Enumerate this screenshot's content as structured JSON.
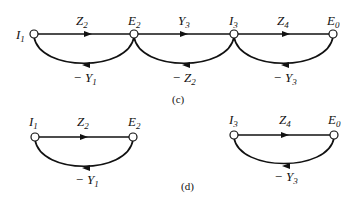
{
  "figure": {
    "c": {
      "caption": "(c)",
      "nodes": [
        {
          "id": "I1",
          "label": "I",
          "sub": "1"
        },
        {
          "id": "E2",
          "label": "E",
          "sub": "2"
        },
        {
          "id": "I3",
          "label": "I",
          "sub": "3"
        },
        {
          "id": "E0",
          "label": "E",
          "sub": "0"
        }
      ],
      "forward_edges": [
        {
          "from": "I1",
          "to": "E2",
          "label": "Z",
          "sub": "2"
        },
        {
          "from": "E2",
          "to": "I3",
          "label": "Y",
          "sub": "3"
        },
        {
          "from": "I3",
          "to": "E0",
          "label": "Z",
          "sub": "4"
        }
      ],
      "feedback_edges": [
        {
          "from": "E2",
          "to": "I1",
          "label": "− Y",
          "sub": "1"
        },
        {
          "from": "I3",
          "to": "E2",
          "label": "− Z",
          "sub": "2"
        },
        {
          "from": "E0",
          "to": "I3",
          "label": "− Y",
          "sub": "3"
        }
      ]
    },
    "d": {
      "caption": "(d)",
      "left": {
        "nodes": [
          {
            "id": "I1",
            "label": "I",
            "sub": "1"
          },
          {
            "id": "E2",
            "label": "E",
            "sub": "2"
          }
        ],
        "forward_edge": {
          "label": "Z",
          "sub": "2"
        },
        "feedback_edge": {
          "label": "− Y",
          "sub": "1"
        }
      },
      "right": {
        "nodes": [
          {
            "id": "I3",
            "label": "I",
            "sub": "3"
          },
          {
            "id": "E0",
            "label": "E",
            "sub": "0"
          }
        ],
        "forward_edge": {
          "label": "Z",
          "sub": "4"
        },
        "feedback_edge": {
          "label": "− Y",
          "sub": "3"
        }
      }
    }
  }
}
